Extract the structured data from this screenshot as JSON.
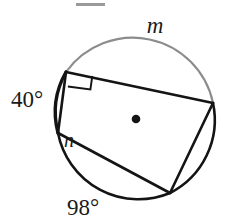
{
  "figure": {
    "kind": "circle-geometry-diagram",
    "background_color": "#ffffff",
    "stroke_color_dark": "#141414",
    "stroke_color_light": "#8c8c8c",
    "label_color": "#1a1a1a",
    "center_dot_label": "center-point",
    "top_crop_bar_color": "#9a9a9a"
  },
  "circle": {
    "center_x": 136,
    "center_y": 119,
    "radius": 82
  },
  "labels": {
    "arc_m": "m",
    "arc_40": "40°",
    "angle_n": "n",
    "arc_98": "98°"
  },
  "vertices": {
    "top_left": {
      "x": 66,
      "y": 72
    },
    "right": {
      "x": 213,
      "y": 103
    },
    "bottom": {
      "x": 170,
      "y": 193
    },
    "left": {
      "x": 58,
      "y": 133
    }
  },
  "marks": {
    "right_angle_at": "top-left-vertex",
    "right_angle_label": "right-angle-square"
  },
  "arcs": {
    "m_arc_shade": "#8c8c8c",
    "other_arc_shade": "#141414"
  }
}
